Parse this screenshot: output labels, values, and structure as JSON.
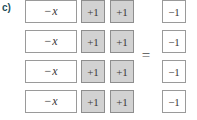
{
  "problem": {
    "label": "c)",
    "equals_symbol": "="
  },
  "tiles": {
    "negative_x": "−x",
    "negative_x_sign": "−",
    "negative_x_variable": "x",
    "plus_one": "+1",
    "minus_one": "−1"
  },
  "rows": [
    {
      "left_side": [
        "−x",
        "+1",
        "+1"
      ],
      "right_side": [
        "−1"
      ]
    },
    {
      "left_side": [
        "−x",
        "+1",
        "+1"
      ],
      "right_side": [
        "−1"
      ]
    },
    {
      "left_side": [
        "−x",
        "+1",
        "+1"
      ],
      "right_side": [
        "−1"
      ]
    },
    {
      "left_side": [
        "−x",
        "+1",
        "+1"
      ],
      "right_side": [
        "−1"
      ]
    }
  ],
  "colors": {
    "label": "#1f4e5a",
    "tile_border": "#9a9a9a",
    "positive_tile_fill": "#d2d2d2",
    "positive_tile_border": "#8e8e8e",
    "negative_tile_fill": "#ffffff",
    "text": "#3a3a3a",
    "background": "#ffffff"
  }
}
